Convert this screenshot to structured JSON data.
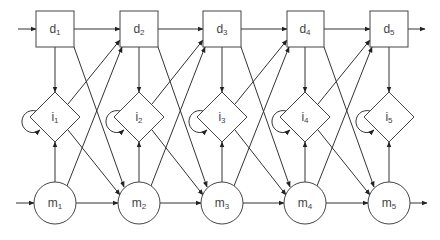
{
  "diagram": {
    "colors": {
      "stroke": "#333333",
      "text": "#444444",
      "background": "#ffffff"
    },
    "columns": [
      1,
      2,
      3,
      4,
      5
    ],
    "rows": {
      "delete": {
        "prefix": "d",
        "shape": "square"
      },
      "insert": {
        "prefix": "i",
        "shape": "diamond",
        "self_loop": true
      },
      "match": {
        "prefix": "m",
        "shape": "circle"
      }
    },
    "nodes": [
      {
        "id": "d1",
        "letter": "d",
        "sub": "1"
      },
      {
        "id": "d2",
        "letter": "d",
        "sub": "2"
      },
      {
        "id": "d3",
        "letter": "d",
        "sub": "3"
      },
      {
        "id": "d4",
        "letter": "d",
        "sub": "4"
      },
      {
        "id": "d5",
        "letter": "d",
        "sub": "5"
      },
      {
        "id": "i1",
        "letter": "i",
        "sub": "1"
      },
      {
        "id": "i2",
        "letter": "i",
        "sub": "2"
      },
      {
        "id": "i3",
        "letter": "i",
        "sub": "3"
      },
      {
        "id": "i4",
        "letter": "i",
        "sub": "4"
      },
      {
        "id": "i5",
        "letter": "i",
        "sub": "5"
      },
      {
        "id": "m1",
        "letter": "m",
        "sub": "1"
      },
      {
        "id": "m2",
        "letter": "m",
        "sub": "2"
      },
      {
        "id": "m3",
        "letter": "m",
        "sub": "3"
      },
      {
        "id": "m4",
        "letter": "m",
        "sub": "4"
      },
      {
        "id": "m5",
        "letter": "m",
        "sub": "5"
      }
    ],
    "edges_pattern": [
      "input -> d1",
      "input -> m1",
      "d_k -> d_k+1",
      "m_k -> m_k+1",
      "d_k -> i_k",
      "m_k -> i_k",
      "i_k -> i_k (self-loop)",
      "i_k -> d_k+1",
      "m_k -> d_k+1",
      "d_k -> m_k+1",
      "i_k -> m_k+1",
      "d5 -> output",
      "m5 -> output"
    ],
    "caption": ""
  }
}
